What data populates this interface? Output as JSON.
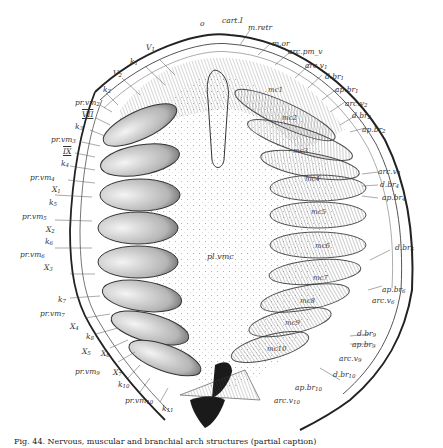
{
  "figure": {
    "type": "anatomical-illustration",
    "top_labels": [
      "o",
      "cart.I",
      "m.retr",
      "m.or",
      "arc.pm_v"
    ],
    "left_labels": [
      {
        "text": "V",
        "sub": "1"
      },
      {
        "text": "k",
        "sub": "1"
      },
      {
        "text": "V",
        "sub": "2"
      },
      {
        "text": "k",
        "sub": "2"
      },
      {
        "text": "pr.vm",
        "sub": "2"
      },
      {
        "text": "VII",
        "sub": ""
      },
      {
        "text": "k",
        "sub": "3"
      },
      {
        "text": "pr.vm",
        "sub": "3"
      },
      {
        "text": "IX",
        "sub": ""
      },
      {
        "text": "k",
        "sub": "4"
      },
      {
        "text": "pr.vm",
        "sub": "4"
      },
      {
        "text": "X",
        "sub": "1"
      },
      {
        "text": "k",
        "sub": "5"
      },
      {
        "text": "pr.vm",
        "sub": "5"
      },
      {
        "text": "X",
        "sub": "2"
      },
      {
        "text": "k",
        "sub": "6"
      },
      {
        "text": "pr.vm",
        "sub": "6"
      },
      {
        "text": "X",
        "sub": "3"
      },
      {
        "text": "k",
        "sub": "7"
      },
      {
        "text": "pr.vm",
        "sub": "7"
      },
      {
        "text": "X",
        "sub": "4"
      },
      {
        "text": "k",
        "sub": "8"
      },
      {
        "text": "X",
        "sub": "5"
      },
      {
        "text": "X",
        "sub": "6"
      },
      {
        "text": "pr.vm",
        "sub": "9"
      },
      {
        "text": "X",
        "sub": "7"
      },
      {
        "text": "k",
        "sub": "10"
      },
      {
        "text": "pr.vm",
        "sub": "10"
      },
      {
        "text": "k",
        "sub": "11"
      }
    ],
    "right_labels": [
      {
        "text": "arc.v",
        "sub": "1"
      },
      {
        "text": "d.br",
        "sub": "1"
      },
      {
        "text": "ap.br",
        "sub": "1"
      },
      {
        "text": "arc.v",
        "sub": "2"
      },
      {
        "text": "d.br",
        "sub": "2"
      },
      {
        "text": "ap.br",
        "sub": "2"
      },
      {
        "text": "arc.v",
        "sub": "4"
      },
      {
        "text": "d.br",
        "sub": "4"
      },
      {
        "text": "ap.br",
        "sub": "4"
      },
      {
        "text": "d.br",
        "sub": "6"
      },
      {
        "text": "ap.br",
        "sub": "6"
      },
      {
        "text": "arc.v",
        "sub": "6"
      },
      {
        "text": "d.br",
        "sub": "9"
      },
      {
        "text": "ap.br",
        "sub": "9"
      },
      {
        "text": "arc.v",
        "sub": "9"
      },
      {
        "text": "d.br",
        "sub": "10"
      },
      {
        "text": "ap.br",
        "sub": "10"
      },
      {
        "text": "arc.v",
        "sub": "10"
      }
    ],
    "inner_labels": [
      "mc1",
      "mc2",
      "mc3",
      "mc4",
      "mc5",
      "mc6",
      "mc7",
      "mc8",
      "mc9",
      "mc10"
    ],
    "center_label": "pl.vmc",
    "colors": {
      "ink": "#333333",
      "shade": "#888888",
      "paper": "#ffffff",
      "dark": "#1a1a1a"
    }
  },
  "caption": "Fig. 44. Nervous, muscular and branchial arch structures (partial caption)"
}
